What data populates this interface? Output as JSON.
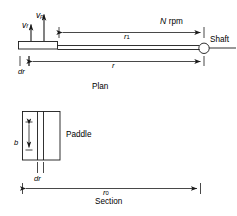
{
  "figure": {
    "line_color": "#1a1a1a",
    "background": "#ffffff"
  },
  "plan": {
    "view_label": "Plan",
    "velocity_fluid": {
      "symbol": "v",
      "subscript": "f"
    },
    "velocity_paddle": {
      "symbol": "v",
      "subscript": "p"
    },
    "speed_label": {
      "symbol": "N",
      "unit": "rpm"
    },
    "shaft_label": "Shaft",
    "dimension_r1": {
      "symbol": "r",
      "subscript": "1"
    },
    "dimension_r": {
      "symbol": "r",
      "subscript": ""
    },
    "dimension_dr": "dr"
  },
  "section": {
    "view_label": "Section",
    "paddle_label": "Paddle",
    "dimension_b": {
      "symbol": "b",
      "subscript": ""
    },
    "dimension_dr": "dr",
    "dimension_r0": {
      "symbol": "r",
      "subscript": "0"
    }
  }
}
